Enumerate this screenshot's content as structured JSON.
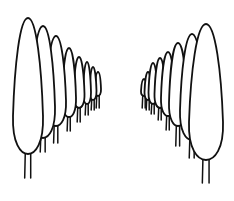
{
  "illustration": {
    "subject": "two rows of cypress trees in perspective",
    "stroke_color": "#111111",
    "background": "#ffffff",
    "left_row": [
      {
        "cx": 28,
        "top": 18,
        "w": 30,
        "bottom": 154,
        "trunk": 178
      },
      {
        "cx": 43,
        "top": 26,
        "w": 24,
        "bottom": 138,
        "trunk": 152
      },
      {
        "cx": 56,
        "top": 36,
        "w": 20,
        "bottom": 126,
        "trunk": 143
      },
      {
        "cx": 69,
        "top": 48,
        "w": 14,
        "bottom": 117,
        "trunk": 131
      },
      {
        "cx": 79,
        "top": 57,
        "w": 11,
        "bottom": 108,
        "trunk": 122
      },
      {
        "cx": 87,
        "top": 62,
        "w": 8,
        "bottom": 104,
        "trunk": 115
      },
      {
        "cx": 93,
        "top": 67,
        "w": 7,
        "bottom": 100,
        "trunk": 110
      },
      {
        "cx": 98,
        "top": 72,
        "w": 6,
        "bottom": 96,
        "trunk": 108
      }
    ],
    "right_row": [
      {
        "cx": 206,
        "top": 24,
        "w": 34,
        "bottom": 160,
        "trunk": 183
      },
      {
        "cx": 192,
        "top": 34,
        "w": 24,
        "bottom": 140,
        "trunk": 158
      },
      {
        "cx": 178,
        "top": 43,
        "w": 18,
        "bottom": 126,
        "trunk": 146
      },
      {
        "cx": 168,
        "top": 52,
        "w": 14,
        "bottom": 116,
        "trunk": 130
      },
      {
        "cx": 160,
        "top": 58,
        "w": 11,
        "bottom": 108,
        "trunk": 120
      },
      {
        "cx": 153,
        "top": 63,
        "w": 9,
        "bottom": 104,
        "trunk": 114
      },
      {
        "cx": 148,
        "top": 72,
        "w": 7,
        "bottom": 100,
        "trunk": 110
      },
      {
        "cx": 144,
        "top": 79,
        "w": 6,
        "bottom": 96,
        "trunk": 108
      }
    ]
  }
}
